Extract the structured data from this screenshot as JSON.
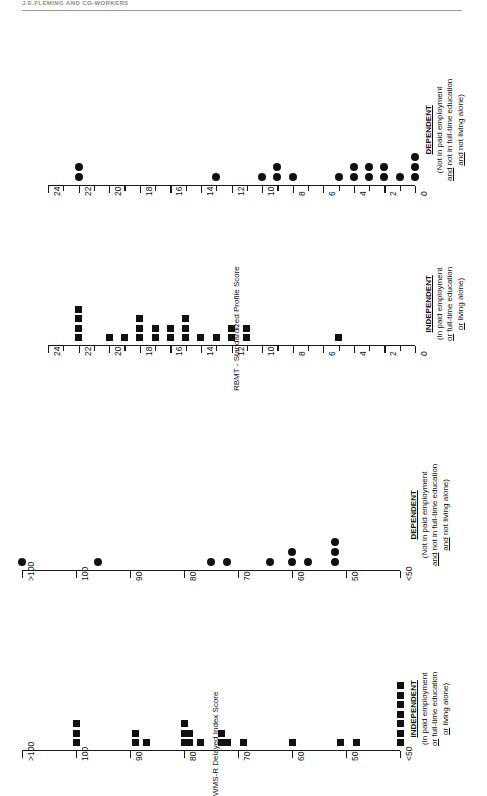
{
  "page": {
    "running_head": "J.E.FLEMING AND CO-WORKERS",
    "rotation_deg": -90
  },
  "axis_titles": {
    "wmsr": "WMS-R Delayed Index Score",
    "rbmt": "RBMT - Standardized Profile Score"
  },
  "group_labels": {
    "independent": {
      "heading": "INDEPENDENT",
      "line1": "(In paid employment",
      "line2_pre": "",
      "line2_u": "or",
      "line2_post": " full-time education",
      "line3_u": "or",
      "line3_post": " living alone)"
    },
    "dependent": {
      "heading": "DEPENDENT",
      "line1": "(Not in paid employment",
      "line2_u": "and",
      "line2_post": " not in full-time education",
      "line3_u": "and",
      "line3_post": " not living alone)"
    }
  },
  "chart_data": [
    {
      "id": "wmsr-independent",
      "type": "scatter",
      "marker": "square",
      "title": "INDEPENDENT",
      "ylabel": "WMS-R Delayed Index Score",
      "axis_ticks": [
        ">100",
        "100",
        "90",
        "80",
        "70",
        "60",
        "50",
        "<50"
      ],
      "axis_tick_values": [
        105,
        100,
        90,
        80,
        70,
        60,
        50,
        45
      ],
      "ylim": [
        45,
        105
      ],
      "grid": false,
      "values": [
        {
          "score": 100,
          "count": 3
        },
        {
          "score": 89,
          "count": 2
        },
        {
          "score": 87,
          "count": 1
        },
        {
          "score": 80,
          "count": 3
        },
        {
          "score": 79,
          "count": 2
        },
        {
          "score": 77,
          "count": 1
        },
        {
          "score": 73,
          "count": 2
        },
        {
          "score": 72,
          "count": 1
        },
        {
          "score": 69,
          "count": 1
        },
        {
          "score": 60,
          "count": 1
        },
        {
          "score": 51,
          "count": 1
        },
        {
          "score": 49,
          "count": 1
        },
        {
          "score": 45,
          "count": 7
        }
      ],
      "n_total": 26
    },
    {
      "id": "wmsr-dependent",
      "type": "scatter",
      "marker": "circle",
      "title": "DEPENDENT",
      "ylabel": "WMS-R Delayed Index Score",
      "axis_ticks": [
        ">100",
        "100",
        "90",
        "80",
        "70",
        "60",
        "50",
        "<50"
      ],
      "axis_tick_values": [
        105,
        100,
        90,
        80,
        70,
        60,
        50,
        45
      ],
      "ylim": [
        45,
        105
      ],
      "grid": false,
      "values": [
        {
          "score": 105,
          "count": 1
        },
        {
          "score": 96,
          "count": 1
        },
        {
          "score": 75,
          "count": 1
        },
        {
          "score": 72,
          "count": 1
        },
        {
          "score": 64,
          "count": 1
        },
        {
          "score": 60,
          "count": 2
        },
        {
          "score": 57,
          "count": 1
        },
        {
          "score": 52,
          "count": 3
        }
      ],
      "n_total": 11
    },
    {
      "id": "rbmt-independent",
      "type": "scatter",
      "marker": "square",
      "title": "INDEPENDENT",
      "ylabel": "RBMT - Standardized Profile Score",
      "axis_ticks": [
        "24",
        "22",
        "20",
        "18",
        "16",
        "14",
        "12",
        "10",
        "8",
        "6",
        "4",
        "2",
        "0"
      ],
      "ylim": [
        0,
        24
      ],
      "grid": false,
      "values": [
        {
          "score": 22,
          "count": 4
        },
        {
          "score": 20,
          "count": 1
        },
        {
          "score": 19,
          "count": 1
        },
        {
          "score": 18,
          "count": 3
        },
        {
          "score": 17,
          "count": 2
        },
        {
          "score": 16,
          "count": 2
        },
        {
          "score": 15,
          "count": 3
        },
        {
          "score": 14,
          "count": 1
        },
        {
          "score": 13,
          "count": 1
        },
        {
          "score": 12,
          "count": 2
        },
        {
          "score": 11,
          "count": 2
        },
        {
          "score": 5,
          "count": 1
        }
      ],
      "n_total": 23
    },
    {
      "id": "rbmt-dependent",
      "type": "scatter",
      "marker": "circle",
      "title": "DEPENDENT",
      "ylabel": "RBMT - Standardized Profile Score",
      "axis_ticks": [
        "24",
        "22",
        "20",
        "18",
        "16",
        "14",
        "12",
        "10",
        "8",
        "6",
        "4",
        "2",
        "0"
      ],
      "ylim": [
        0,
        24
      ],
      "grid": false,
      "values": [
        {
          "score": 22,
          "count": 2
        },
        {
          "score": 13,
          "count": 1
        },
        {
          "score": 10,
          "count": 1
        },
        {
          "score": 9,
          "count": 2
        },
        {
          "score": 8,
          "count": 1
        },
        {
          "score": 5,
          "count": 1
        },
        {
          "score": 4,
          "count": 2
        },
        {
          "score": 3,
          "count": 2
        },
        {
          "score": 2,
          "count": 2
        },
        {
          "score": 1,
          "count": 1
        },
        {
          "score": 0,
          "count": 3
        }
      ],
      "n_total": 18
    }
  ]
}
